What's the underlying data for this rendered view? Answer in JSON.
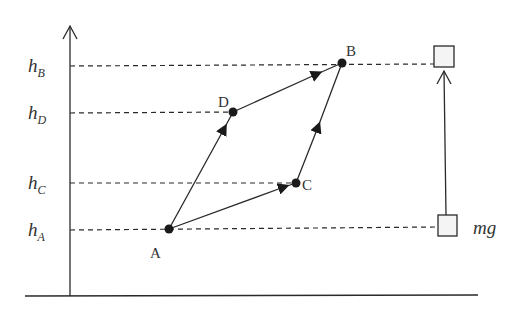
{
  "diagram": {
    "axis": {
      "type": "height-axis",
      "arrow": "up"
    },
    "levels": [
      {
        "id": "hB",
        "main": "h",
        "sub": "B",
        "y": 66
      },
      {
        "id": "hD",
        "main": "h",
        "sub": "D",
        "y": 113
      },
      {
        "id": "hC",
        "main": "h",
        "sub": "C",
        "y": 183
      },
      {
        "id": "hA",
        "main": "h",
        "sub": "A",
        "y": 230
      }
    ],
    "points": [
      {
        "id": "A",
        "label": "A",
        "x": 169,
        "y": 229
      },
      {
        "id": "B",
        "label": "B",
        "x": 342,
        "y": 63
      },
      {
        "id": "C",
        "label": "C",
        "x": 296,
        "y": 183
      },
      {
        "id": "D",
        "label": "D",
        "x": 233,
        "y": 112
      }
    ],
    "paths": [
      {
        "from": "A",
        "to": "D"
      },
      {
        "from": "D",
        "to": "B"
      },
      {
        "from": "A",
        "to": "C"
      },
      {
        "from": "C",
        "to": "B"
      }
    ],
    "object": {
      "start_box": "bottom",
      "end_box": "top",
      "force_label": "mg"
    }
  }
}
